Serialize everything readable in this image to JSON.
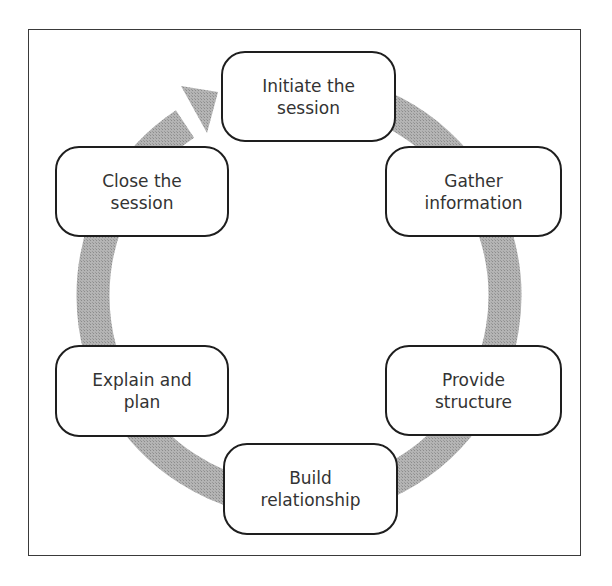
{
  "diagram": {
    "type": "cycle",
    "direction": "clockwise",
    "ring_color": "#a8a8a8",
    "border_color": "#1e1e1e",
    "nodes": [
      {
        "id": "initiate",
        "label": "Initiate the\nsession"
      },
      {
        "id": "gather",
        "label": "Gather\ninformation"
      },
      {
        "id": "structure",
        "label": "Provide\nstructure"
      },
      {
        "id": "relationship",
        "label": "Build\nrelationship"
      },
      {
        "id": "explain",
        "label": "Explain and\nplan"
      },
      {
        "id": "close",
        "label": "Close the\nsession"
      }
    ],
    "edges": [
      {
        "from": "initiate",
        "to": "gather"
      },
      {
        "from": "gather",
        "to": "structure"
      },
      {
        "from": "structure",
        "to": "relationship"
      },
      {
        "from": "relationship",
        "to": "explain"
      },
      {
        "from": "explain",
        "to": "close"
      },
      {
        "from": "close",
        "to": "initiate",
        "arrowhead": true
      }
    ]
  }
}
